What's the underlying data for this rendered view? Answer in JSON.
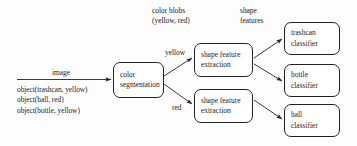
{
  "diagram": {
    "background_color": "#fdfdfd",
    "stroke_color": "#222222",
    "text_color": "#1a1a1a",
    "input": {
      "arrow_label": "image",
      "predicates": [
        "object(trashcan, yellow)",
        "object(ball, red)",
        "object(bottle, yellow)"
      ]
    },
    "annotations": {
      "color_blobs": [
        "color blobs",
        "(yellow, red)"
      ],
      "shape_features": [
        "shape",
        "features"
      ]
    },
    "edge_labels": {
      "yellow": "yellow",
      "red": "red"
    },
    "nodes": {
      "color_segmentation": [
        "color",
        "segmentation"
      ],
      "shape_feature_extraction_top": [
        "shape feature",
        "extraction"
      ],
      "shape_feature_extraction_bottom": [
        "shape feature",
        "extraction"
      ],
      "trashcan_classifier": [
        "trashcan",
        "classifier"
      ],
      "bottle_classifier": [
        "bottle",
        "classifier"
      ],
      "ball_classifier": [
        "ball",
        "classifier"
      ]
    }
  }
}
